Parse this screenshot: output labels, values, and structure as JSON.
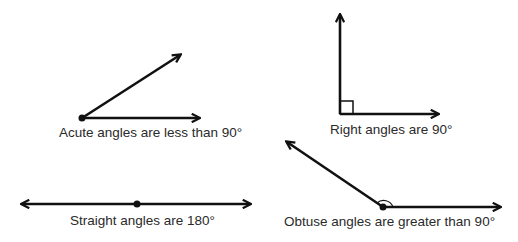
{
  "diagram": {
    "angles": [
      {
        "id": "acute",
        "label": "Acute angles are less than 90°",
        "degrees_description": "less than 90°"
      },
      {
        "id": "right",
        "label": "Right angles are 90°",
        "degrees_description": "90°"
      },
      {
        "id": "straight",
        "label": "Straight angles are 180°",
        "degrees_description": "180°"
      },
      {
        "id": "obtuse",
        "label": "Obtuse angles are greater than 90°",
        "degrees_description": "greater than 90°"
      }
    ],
    "colors": {
      "stroke": "#111111",
      "text": "#2a2a2a",
      "background": "#ffffff"
    }
  }
}
